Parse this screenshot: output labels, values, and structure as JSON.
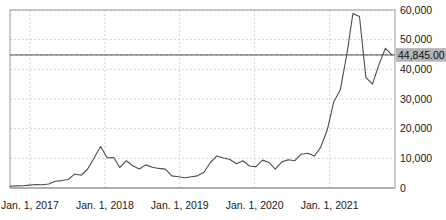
{
  "chart_data": {
    "type": "line",
    "title": "",
    "subtitle": "",
    "xlabel": "",
    "ylabel": "",
    "grid": true,
    "legend_position": "none",
    "ylim": [
      0,
      60000
    ],
    "xlim": [
      "2016-10-01",
      "2021-09-15"
    ],
    "y_ticks": [
      0,
      10000,
      20000,
      30000,
      40000,
      50000,
      60000
    ],
    "y_tick_labels": [
      "0",
      "10,000",
      "20,000",
      "30,000",
      "40,000",
      "50,000",
      "60,000"
    ],
    "x_ticks": [
      "2017-01-01",
      "2018-01-01",
      "2019-01-01",
      "2020-01-01",
      "2021-01-01"
    ],
    "x_tick_labels": [
      "Jan. 1, 2017",
      "Jan. 1, 2018",
      "Jan. 1, 2019",
      "Jan. 1, 2020",
      "Jan. 1, 2021"
    ],
    "reference_line": {
      "value": 44845,
      "label": "44,845.00",
      "style": "solid"
    },
    "series": [
      {
        "name": "Price",
        "color": "#4d4d4d",
        "x": [
          "2016-10-01",
          "2016-11-01",
          "2016-12-01",
          "2017-01-01",
          "2017-02-01",
          "2017-03-01",
          "2017-04-01",
          "2017-05-01",
          "2017-06-01",
          "2017-07-01",
          "2017-08-01",
          "2017-09-01",
          "2017-10-01",
          "2017-11-01",
          "2017-12-01",
          "2018-01-01",
          "2018-02-01",
          "2018-03-01",
          "2018-04-01",
          "2018-05-01",
          "2018-06-01",
          "2018-07-01",
          "2018-08-01",
          "2018-09-01",
          "2018-10-01",
          "2018-11-01",
          "2018-12-01",
          "2019-01-01",
          "2019-02-01",
          "2019-03-01",
          "2019-04-01",
          "2019-05-01",
          "2019-06-01",
          "2019-07-01",
          "2019-08-01",
          "2019-09-01",
          "2019-10-01",
          "2019-11-01",
          "2019-12-01",
          "2020-01-01",
          "2020-02-01",
          "2020-03-01",
          "2020-04-01",
          "2020-05-01",
          "2020-06-01",
          "2020-07-01",
          "2020-08-01",
          "2020-09-01",
          "2020-10-01",
          "2020-11-01",
          "2020-12-01",
          "2021-01-01",
          "2021-02-01",
          "2021-03-01",
          "2021-04-01",
          "2021-05-01",
          "2021-06-01",
          "2021-07-01",
          "2021-08-01",
          "2021-09-01"
        ],
        "values": [
          610,
          700,
          760,
          970,
          1180,
          1080,
          1350,
          2300,
          2500,
          2870,
          4700,
          4300,
          6400,
          10200,
          14000,
          10200,
          10300,
          6900,
          9200,
          7500,
          6400,
          7800,
          7000,
          6600,
          6350,
          4100,
          3800,
          3450,
          3800,
          4100,
          5300,
          8600,
          10800,
          10100,
          9600,
          8200,
          9200,
          7400,
          7200,
          9400,
          8600,
          6400,
          8800,
          9500,
          9200,
          11400,
          11700,
          10800,
          13800,
          19700,
          29000,
          33100,
          45200,
          58800,
          57800,
          37300,
          35000,
          41500,
          47100,
          44845
        ]
      }
    ]
  },
  "value_callout": {
    "text": "44,845.00"
  }
}
